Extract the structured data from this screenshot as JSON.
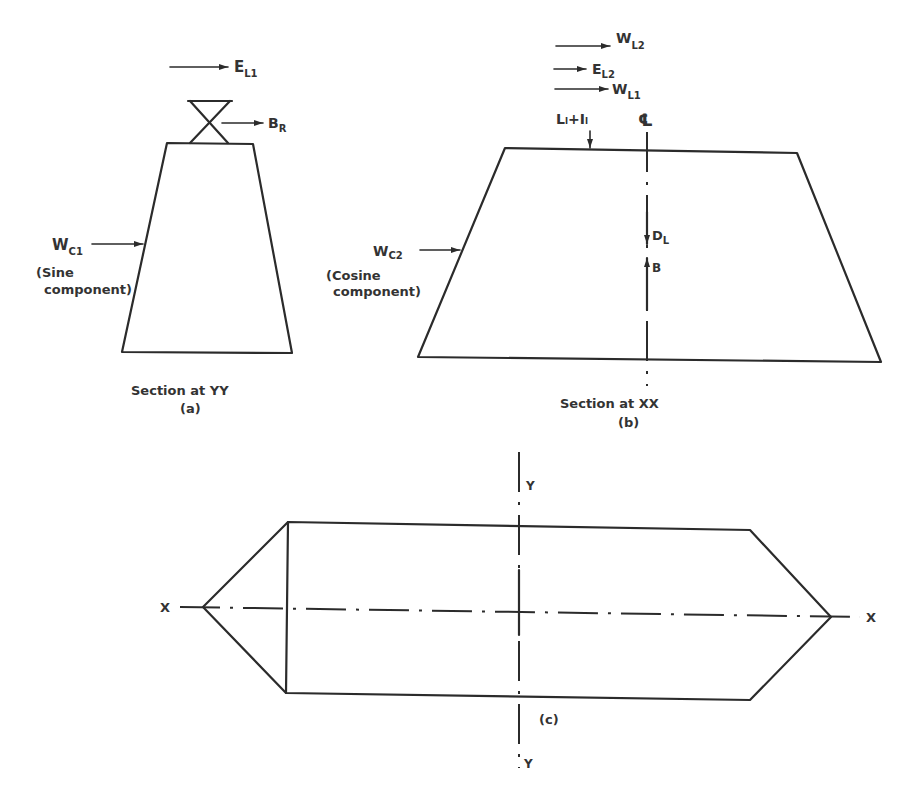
{
  "panel_a": {
    "loads": {
      "el1": {
        "base": "E",
        "sub": "L1"
      },
      "br": {
        "base": "B",
        "sub": "R"
      },
      "wc1": {
        "base": "W",
        "sub": "C1"
      }
    },
    "wc1_note_line1": "(Sine",
    "wc1_note_line2": "component)",
    "caption": "Section at YY",
    "tag": "(a)"
  },
  "panel_b": {
    "loads": {
      "wl2": {
        "base": "W",
        "sub": "L2"
      },
      "el2": {
        "base": "E",
        "sub": "L2"
      },
      "wl1": {
        "base": "W",
        "sub": "L1"
      },
      "llil": "Lₗ+Iₗ",
      "wc2": {
        "base": "W",
        "sub": "C2"
      },
      "dl": {
        "base": "D",
        "sub": "L"
      },
      "b": "B"
    },
    "centerline_symbol": "℄",
    "wc2_note_line1": "(Cosine",
    "wc2_note_line2": "component)",
    "caption": "Section at XX",
    "tag": "(b)"
  },
  "panel_c": {
    "axis_x_left": "X",
    "axis_x_right": "X",
    "axis_y_top": "Y",
    "axis_y_bottom": "Y",
    "tag": "(c)"
  },
  "colors": {
    "ink": "#2b2b2b",
    "background": "#ffffff"
  }
}
